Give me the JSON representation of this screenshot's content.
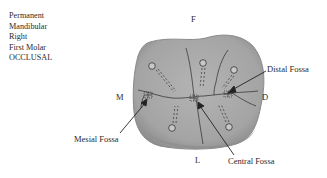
{
  "caption": {
    "lines": [
      "Permanent",
      "Mandibular",
      "Right",
      "First Molar",
      "OCCLUSAL"
    ]
  },
  "orientation": {
    "top": "F",
    "bottom": "L",
    "left": "M",
    "right": "D"
  },
  "callouts": {
    "mesial": "Mesial Fossa",
    "central": "Central Fossa",
    "distal": "Distal Fossa"
  },
  "colors": {
    "tooth_fill": "#a9a9a9",
    "tooth_edge": "#8a8a8a",
    "groove": "#3a3a3a",
    "text": "#2a2a2a"
  }
}
